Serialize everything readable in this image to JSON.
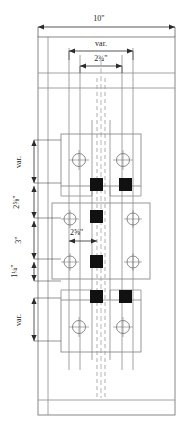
{
  "drawing": {
    "type": "structural-steel-splice-connection-detail",
    "view": "elevation",
    "background_color": "#ffffff",
    "line_color": "#6e6e6e",
    "dim_line_color": "#3a3a3a",
    "bolt_fill_color": "#111111",
    "text_color": "#1a1a1a"
  },
  "dimensions": {
    "overall_width": {
      "label": "10\"",
      "orientation": "horizontal",
      "position": "top",
      "name": "overall-column-width"
    },
    "plate_width_var": {
      "label": "var.",
      "orientation": "horizontal",
      "position": "top-inner",
      "name": "splice-plate-width-variable"
    },
    "bolt_gage": {
      "label": "2¾\"",
      "whole": "2",
      "fraction": "¾",
      "unit": "\"",
      "orientation": "horizontal",
      "position": "top-inner-2",
      "name": "bolt-gage-horizontal"
    },
    "upper_var": {
      "label": "var.",
      "orientation": "vertical",
      "position": "left-1",
      "name": "upper-plate-edge-distance-variable"
    },
    "upper_spacing": {
      "label": "2⅝\"",
      "whole": "2",
      "fraction": "⅝",
      "unit": "\"",
      "orientation": "vertical",
      "position": "left-2",
      "name": "upper-bolt-spacing"
    },
    "middle_spacing": {
      "label": "3\"",
      "orientation": "vertical",
      "position": "left-3",
      "name": "middle-plate-bolt-spacing"
    },
    "lower_edge": {
      "label": "1¼\"",
      "whole": "1",
      "fraction": "¼",
      "unit": "\"",
      "orientation": "vertical",
      "position": "left-4",
      "name": "lower-edge-distance"
    },
    "lower_var": {
      "label": "var.",
      "orientation": "vertical",
      "position": "left-5",
      "name": "lower-plate-edge-distance-variable"
    },
    "interior_bolt_gage": {
      "label": "2⅝\"",
      "whole": "2",
      "fraction": "⅝",
      "unit": "\"",
      "orientation": "horizontal",
      "position": "center-interior",
      "name": "interior-bolt-gage"
    }
  },
  "components": {
    "column": {
      "name": "column-outline"
    },
    "top_flange": {
      "name": "top-flange-band"
    },
    "bottom_flange": {
      "name": "bottom-flange-band"
    },
    "web_centerline": {
      "name": "web-centerline"
    },
    "upper_splice_plate": {
      "name": "upper-splice-plate",
      "bolt_holes": 2
    },
    "middle_splice_plate": {
      "name": "middle-splice-plate",
      "bolt_holes": 4
    },
    "lower_splice_plate": {
      "name": "lower-splice-plate",
      "bolt_holes": 2
    },
    "filled_bolts": {
      "name": "filled-bolt-group",
      "count": 4
    }
  }
}
